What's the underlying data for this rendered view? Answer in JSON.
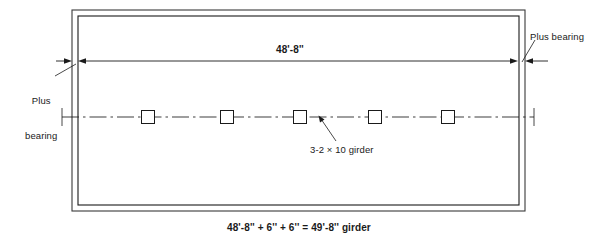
{
  "drawing": {
    "title": "Girder framing plan",
    "labels": {
      "plus_bearing_left_line1": "Plus",
      "plus_bearing_left_line2": "bearing",
      "plus_bearing_right": "Plus bearing",
      "span_dimension": "48'-8''",
      "girder_callout": "3-2 × 10 girder",
      "bottom_caption": "48'-8'' + 6'' + 6'' = 49'-8'' girder"
    },
    "colors": {
      "line": "#1a1a1a",
      "background": "#ffffff",
      "text": "#1a1a1a"
    },
    "geometry": {
      "frame_outer": {
        "x": 72,
        "y": 10,
        "width": 453,
        "height": 201
      },
      "frame_inner": {
        "x": 78,
        "y": 16,
        "width": 441,
        "height": 189
      },
      "dimension_line_y": 61,
      "dimension_left_x": 78,
      "dimension_right_x": 518,
      "centerline_y": 117,
      "centerline_start_x": 62,
      "centerline_end_x": 534,
      "post_size": 13,
      "post_centers_x": [
        148,
        227,
        300,
        375,
        448
      ],
      "post_count": 5
    }
  }
}
